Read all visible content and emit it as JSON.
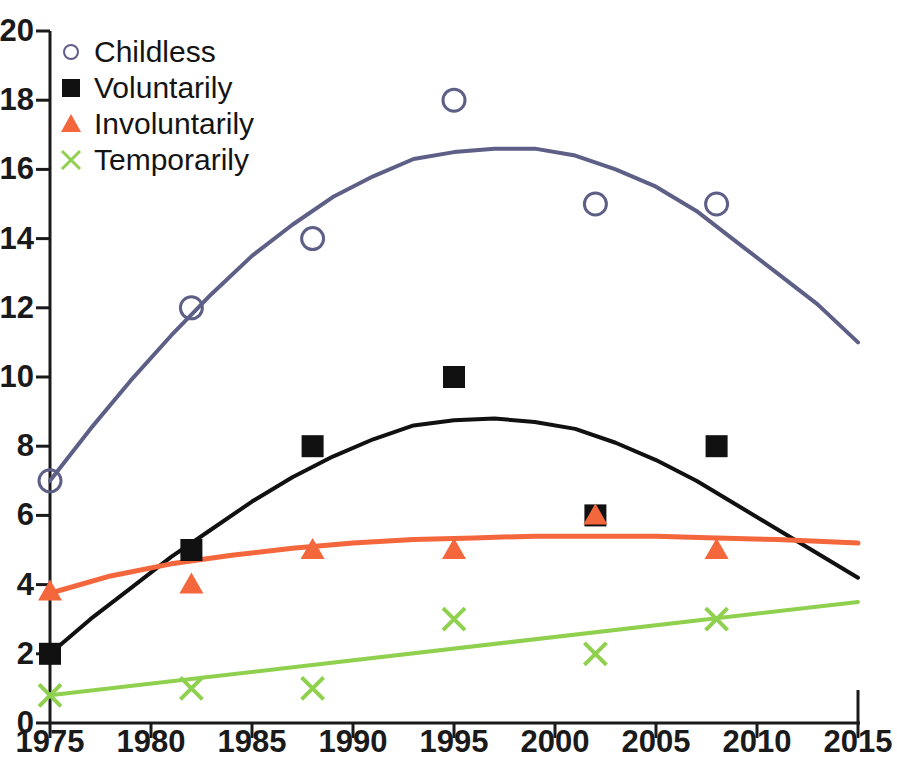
{
  "chart_data": {
    "type": "scatter",
    "title": "",
    "xlabel": "",
    "ylabel": "",
    "xlim": [
      1975,
      2015
    ],
    "ylim": [
      0,
      20
    ],
    "x_ticks": [
      1975,
      1980,
      1985,
      1990,
      1995,
      2000,
      2005,
      2010,
      2015
    ],
    "y_ticks": [
      0,
      2,
      4,
      6,
      8,
      10,
      12,
      14,
      16,
      18,
      20
    ],
    "grid": false,
    "legend_position": "top-left",
    "x": [
      1975,
      1982,
      1988,
      1995,
      2002,
      2008
    ],
    "series": [
      {
        "name": "Childless",
        "marker": "open-circle",
        "color": "#5d5f86",
        "values": [
          7,
          12,
          14,
          18,
          15,
          15
        ],
        "trend": {
          "type": "quadratic-fit",
          "points": [
            [
              1975,
              7.0
            ],
            [
              1977,
              8.5
            ],
            [
              1979,
              9.9
            ],
            [
              1981,
              11.2
            ],
            [
              1983,
              12.4
            ],
            [
              1985,
              13.5
            ],
            [
              1987,
              14.4
            ],
            [
              1989,
              15.2
            ],
            [
              1991,
              15.8
            ],
            [
              1993,
              16.3
            ],
            [
              1995,
              16.5
            ],
            [
              1997,
              16.6
            ],
            [
              1999,
              16.6
            ],
            [
              2001,
              16.4
            ],
            [
              2003,
              16.0
            ],
            [
              2005,
              15.5
            ],
            [
              2007,
              14.8
            ],
            [
              2009,
              13.9
            ],
            [
              2011,
              13.0
            ],
            [
              2013,
              12.1
            ],
            [
              2015,
              11.0
            ]
          ]
        }
      },
      {
        "name": "Voluntarily",
        "marker": "filled-square",
        "color": "#111111",
        "values": [
          2,
          5,
          8,
          10,
          6,
          8
        ],
        "trend": {
          "type": "quadratic-fit",
          "points": [
            [
              1975,
              2.0
            ],
            [
              1977,
              3.0
            ],
            [
              1979,
              3.9
            ],
            [
              1981,
              4.8
            ],
            [
              1983,
              5.6
            ],
            [
              1985,
              6.4
            ],
            [
              1987,
              7.1
            ],
            [
              1989,
              7.7
            ],
            [
              1991,
              8.2
            ],
            [
              1993,
              8.6
            ],
            [
              1995,
              8.75
            ],
            [
              1997,
              8.8
            ],
            [
              1999,
              8.7
            ],
            [
              2001,
              8.5
            ],
            [
              2003,
              8.1
            ],
            [
              2005,
              7.6
            ],
            [
              2007,
              7.0
            ],
            [
              2009,
              6.3
            ],
            [
              2011,
              5.6
            ],
            [
              2013,
              4.9
            ],
            [
              2015,
              4.2
            ]
          ]
        }
      },
      {
        "name": "Involuntarily",
        "marker": "filled-triangle",
        "color": "#f4663c",
        "values": [
          3.8,
          4,
          5,
          5,
          6,
          5
        ],
        "trend": {
          "type": "quadratic-fit",
          "points": [
            [
              1975,
              3.75
            ],
            [
              1978,
              4.25
            ],
            [
              1981,
              4.6
            ],
            [
              1984,
              4.85
            ],
            [
              1987,
              5.05
            ],
            [
              1990,
              5.2
            ],
            [
              1993,
              5.3
            ],
            [
              1996,
              5.35
            ],
            [
              1999,
              5.4
            ],
            [
              2002,
              5.4
            ],
            [
              2005,
              5.4
            ],
            [
              2008,
              5.35
            ],
            [
              2011,
              5.3
            ],
            [
              2015,
              5.2
            ]
          ]
        }
      },
      {
        "name": "Temporarily",
        "marker": "cross-x",
        "color": "#8fd14f",
        "values": [
          0.8,
          1,
          1,
          3,
          2,
          3
        ],
        "trend": {
          "type": "linear-fit",
          "points": [
            [
              1975,
              0.8
            ],
            [
              2015,
              3.5
            ]
          ]
        }
      }
    ]
  },
  "axes": {
    "y_labels": [
      "0",
      "2",
      "4",
      "6",
      "8",
      "10",
      "12",
      "14",
      "16",
      "18",
      "20"
    ],
    "x_labels": [
      "1975",
      "1980",
      "1985",
      "1990",
      "1995",
      "2000",
      "2005",
      "2010",
      "2015"
    ]
  },
  "legend": {
    "items": [
      {
        "label": "Childless",
        "marker": "open-circle-icon",
        "color": "#5d5f86"
      },
      {
        "label": "Voluntarily",
        "marker": "filled-square-icon",
        "color": "#111111"
      },
      {
        "label": "Involuntarily",
        "marker": "filled-triangle-icon",
        "color": "#f4663c"
      },
      {
        "label": "Temporarily",
        "marker": "cross-x-icon",
        "color": "#8fd14f"
      }
    ]
  },
  "colors": {
    "axis": "#1a1a1a",
    "background": "#ffffff",
    "childless": "#5d5f86",
    "voluntarily": "#111111",
    "involuntarily": "#f4663c",
    "temporarily": "#8fd14f"
  }
}
